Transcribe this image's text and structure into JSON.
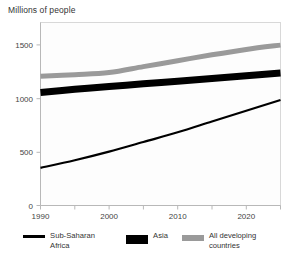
{
  "chart_data": {
    "type": "line",
    "title": "Millions of people",
    "xlabel": "",
    "ylabel": "Millions of people",
    "xlim": [
      1990,
      2025
    ],
    "ylim": [
      0,
      1700
    ],
    "xticks": [
      1990,
      2000,
      2010,
      2020
    ],
    "xtick_labels": [
      "1990",
      "2000",
      "2010",
      "2020"
    ],
    "xminor_ticks": [
      1995,
      2005,
      2015,
      2025
    ],
    "yticks": [
      0,
      500,
      1000,
      1500
    ],
    "ytick_labels": [
      "0",
      "500",
      "1000",
      "1500"
    ],
    "grid": false,
    "legend_position": "bottom",
    "x": [
      1990,
      1995,
      2000,
      2005,
      2010,
      2015,
      2020,
      2025
    ],
    "series": [
      {
        "name": "Sub-Saharan Africa",
        "color": "#000000",
        "style": "thin-line",
        "values": [
          350,
          420,
          500,
          590,
          680,
          780,
          880,
          980
        ]
      },
      {
        "name": "Asia",
        "color": "#000000",
        "style": "thick-line",
        "values": [
          1050,
          1080,
          1105,
          1130,
          1155,
          1180,
          1205,
          1230
        ]
      },
      {
        "name": "All developing countries",
        "color": "#9a9a9a",
        "style": "thick-line",
        "values": [
          1200,
          1215,
          1235,
          1290,
          1345,
          1400,
          1450,
          1490
        ]
      }
    ]
  },
  "legend": {
    "items": [
      {
        "label": "Sub-Saharan Africa",
        "swatch": "thin-black-line-swatch"
      },
      {
        "label": "Asia",
        "swatch": "thick-black-bar-swatch"
      },
      {
        "label": "All developing countries",
        "swatch": "thick-gray-bar-swatch"
      }
    ]
  },
  "axis": {
    "y_labels": [
      "1500",
      "1000",
      "500",
      "0"
    ],
    "x_labels": [
      "1990",
      "2000",
      "2010",
      "2020"
    ]
  }
}
